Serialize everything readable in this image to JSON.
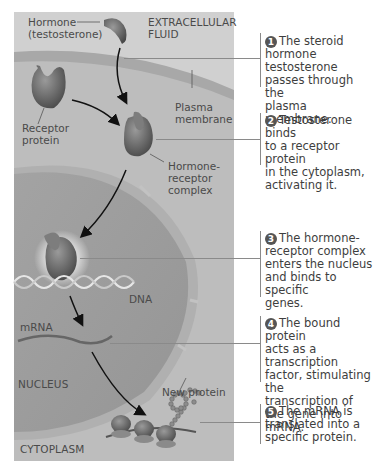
{
  "diagram": {
    "regions": {
      "extracellular": "EXTRACELLULAR\nFLUID",
      "nucleus": "NUCLEUS",
      "cytoplasm": "CYTOPLASM"
    },
    "labels": {
      "hormone_line1": "Hormone",
      "hormone_line2": "(testosterone)",
      "extracellular_line1": "EXTRACELLULAR",
      "extracellular_line2": "FLUID",
      "plasma_line1": "Plasma",
      "plasma_line2": "membrane",
      "receptor_line1": "Receptor",
      "receptor_line2": "protein",
      "complex_line1": "Hormone-",
      "complex_line2": "receptor",
      "complex_line3": "complex",
      "dna": "DNA",
      "mrna": "mRNA",
      "nucleus": "NUCLEUS",
      "new_protein": "New protein",
      "cytoplasm": "CYTOPLASM"
    },
    "steps": [
      {
        "number": "1",
        "lines": [
          "The steroid",
          "hormone testosterone",
          "passes through the",
          "plasma membrane."
        ]
      },
      {
        "number": "2",
        "lines": [
          "Testosterone binds",
          "to a receptor protein",
          "in the cytoplasm,",
          "activating it."
        ]
      },
      {
        "number": "3",
        "lines": [
          "The hormone-",
          "receptor complex",
          "enters the nucleus",
          "and binds to specific",
          "genes."
        ]
      },
      {
        "number": "4",
        "lines": [
          "The bound protein",
          "acts as a transcription",
          "factor, stimulating the",
          "transcription of",
          "the gene into mRNA."
        ]
      },
      {
        "number": "5",
        "lines": [
          "The mRNA is",
          "translated into a",
          "specific protein."
        ]
      }
    ],
    "colors": {
      "extracellular_bg": "#cfcfcf",
      "cytoplasm_bg": "#bdbdbd",
      "membrane": "#a9a9a9",
      "nucleus_bg": "#9e9e9e",
      "nuclear_envelope": "#b3b3b3",
      "protein": "#6e6e6e",
      "number_circle": "#555555",
      "leader_line": "#8a8a8a"
    }
  }
}
